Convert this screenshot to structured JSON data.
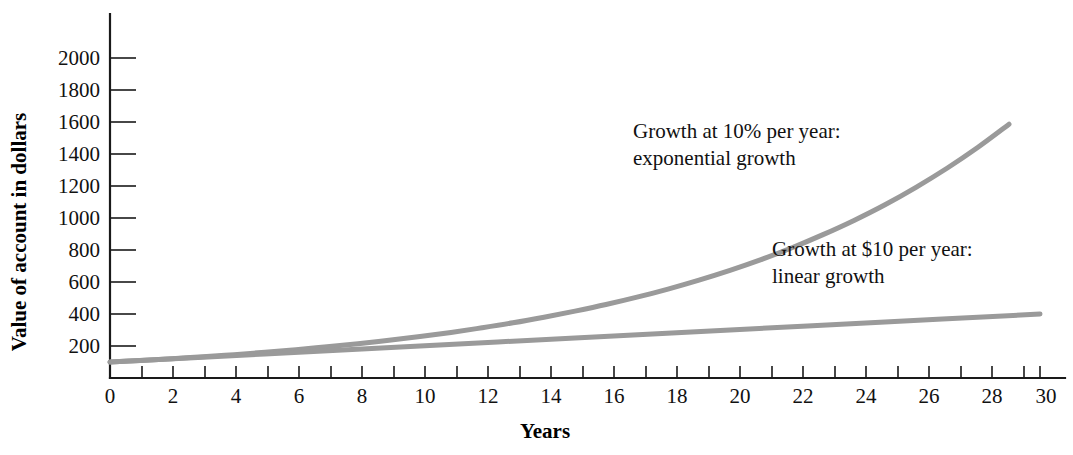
{
  "chart_data": {
    "type": "line",
    "title": "",
    "xlabel": "Years",
    "ylabel": "Value of account in dollars",
    "xlim": [
      0,
      30
    ],
    "ylim": [
      0,
      2100
    ],
    "grid": false,
    "legend_position": "inline-annotations",
    "x_ticks_major": [
      0,
      2,
      4,
      6,
      8,
      10,
      12,
      14,
      16,
      18,
      20,
      22,
      24,
      26,
      28,
      30
    ],
    "x_ticks_minor": [
      1,
      3,
      5,
      7,
      9,
      11,
      13,
      15,
      17,
      19,
      21,
      23,
      25,
      27,
      29
    ],
    "x_tick_labels": [
      "0",
      "2",
      "4",
      "6",
      "8",
      "10",
      "12",
      "14",
      "16",
      "18",
      "20",
      "22",
      "24",
      "26",
      "28",
      "30"
    ],
    "y_ticks": [
      200,
      400,
      600,
      800,
      1000,
      1200,
      1400,
      1600,
      1800,
      2000
    ],
    "y_tick_labels": [
      "200",
      "400",
      "600",
      "800",
      "1000",
      "1200",
      "1400",
      "1600",
      "1800",
      "2000"
    ],
    "series": [
      {
        "name": "exponential growth",
        "annotation": "Growth at 10% per year:\nexponential growth",
        "color": "#9a9a9a",
        "x": [
          0,
          1,
          2,
          3,
          4,
          5,
          6,
          7,
          8,
          9,
          10,
          11,
          12,
          13,
          14,
          15,
          16,
          17,
          18,
          19,
          20,
          21,
          22,
          23,
          24,
          25,
          26,
          27,
          28,
          29
        ],
        "values": [
          100,
          110,
          121,
          133,
          146,
          161,
          177,
          195,
          214,
          236,
          259,
          285,
          314,
          345,
          380,
          418,
          459,
          505,
          556,
          612,
          673,
          740,
          814,
          896,
          985,
          1083,
          1192,
          1311,
          1442,
          1586
        ]
      },
      {
        "name": "linear growth",
        "annotation": "Growth at $10 per year:\nlinear growth",
        "color": "#9a9a9a",
        "x": [
          0,
          5,
          10,
          15,
          20,
          25,
          30
        ],
        "values": [
          100,
          150,
          200,
          250,
          300,
          350,
          400
        ]
      }
    ]
  },
  "annotations": {
    "exponential": {
      "line1": "Growth at 10% per year:",
      "line2": "exponential growth"
    },
    "linear": {
      "line1": "Growth at $10 per year:",
      "line2": "linear growth"
    }
  },
  "axes": {
    "x_title": "Years",
    "y_title": "Value of account in dollars"
  },
  "colors": {
    "series_line": "#9a9a9a",
    "axis": "#1a1a1a",
    "text": "#111111",
    "background": "#ffffff"
  }
}
